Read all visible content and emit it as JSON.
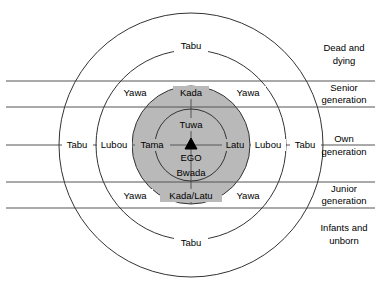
{
  "diagram": {
    "colors": {
      "shaded_circle": "#b9b9b9",
      "outline": "#333333",
      "gridline": "#555555",
      "background": "#ffffff",
      "text": "#000000"
    },
    "geometry": {
      "center_x": 191,
      "center_y": 145,
      "circle_radii": [
        36,
        59,
        95,
        132
      ],
      "horizontal_lines_y": [
        81,
        107,
        145,
        182,
        208
      ],
      "vertical_line_x": 191
    },
    "right_labels": [
      {
        "id": "dead-and-dying",
        "line1": "Dead and",
        "line2": "dying",
        "y": 55
      },
      {
        "id": "senior-generation",
        "line1": "Senior",
        "line2": "generation",
        "y": 94
      },
      {
        "id": "own-generation",
        "line1": "Own",
        "line2": "generation",
        "y": 145
      },
      {
        "id": "junior-generation",
        "line1": "Junior",
        "line2": "generation",
        "y": 195
      },
      {
        "id": "infants-and-unborn",
        "line1": "Infants and",
        "line2": "unborn",
        "y": 235
      }
    ],
    "ring_labels": [
      {
        "id": "tabu-top",
        "text": "Tabu",
        "x": 191,
        "y": 46
      },
      {
        "id": "tabu-bottom",
        "text": "Tabu",
        "x": 191,
        "y": 243
      },
      {
        "id": "yawa-top-left",
        "text": "Yawa",
        "x": 135,
        "y": 93
      },
      {
        "id": "yawa-top-right",
        "text": "Yawa",
        "x": 248,
        "y": 93
      },
      {
        "id": "yawa-bottom-left",
        "text": "Yawa",
        "x": 135,
        "y": 196
      },
      {
        "id": "yawa-bottom-right",
        "text": "Yawa",
        "x": 248,
        "y": 196
      },
      {
        "id": "kada",
        "text": "Kada",
        "x": 191,
        "y": 93
      },
      {
        "id": "kada-latu",
        "text": "Kada/Latu",
        "x": 191,
        "y": 196
      },
      {
        "id": "tuwa",
        "text": "Tuwa",
        "x": 191,
        "y": 125
      },
      {
        "id": "ego",
        "text": "EGO",
        "x": 191,
        "y": 158
      },
      {
        "id": "bwada",
        "text": "Bwada",
        "x": 191,
        "y": 173
      }
    ],
    "axis_labels": [
      {
        "id": "tabu-left",
        "text": "Tabu",
        "x": 77,
        "y": 145
      },
      {
        "id": "lubou-left",
        "text": "Lubou",
        "x": 114,
        "y": 145
      },
      {
        "id": "tama",
        "text": "Tama",
        "x": 152,
        "y": 145
      },
      {
        "id": "latu",
        "text": "Latu",
        "x": 235,
        "y": 145
      },
      {
        "id": "lubou-right",
        "text": "Lubou",
        "x": 268,
        "y": 145
      },
      {
        "id": "tabu-right",
        "text": "Tabu",
        "x": 305,
        "y": 145
      }
    ],
    "ego_marker": {
      "id": "ego-triangle",
      "x": 191,
      "y": 145
    }
  }
}
